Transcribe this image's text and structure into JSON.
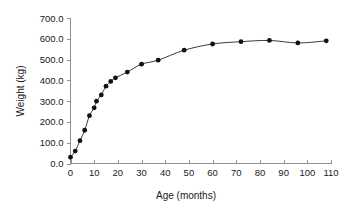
{
  "chart_data": {
    "type": "line",
    "title": "",
    "xlabel": "Age (months)",
    "ylabel": "Weight (kg)",
    "xlim": [
      0,
      110
    ],
    "ylim": [
      0,
      700
    ],
    "grid": false,
    "legend": null,
    "marker": "filled-circle",
    "line_color": "#3a3a3a",
    "marker_color": "#111111",
    "xticks": [
      0,
      10,
      20,
      30,
      40,
      50,
      60,
      70,
      80,
      90,
      100,
      110
    ],
    "xtick_labels": [
      "0",
      "10",
      "20",
      "30",
      "40",
      "50",
      "60",
      "70",
      "80",
      "90",
      "100",
      "110"
    ],
    "yticks": [
      0,
      100,
      200,
      300,
      400,
      500,
      600,
      700
    ],
    "ytick_labels": [
      "0.0",
      "100.0",
      "200.0",
      "300.0",
      "400.0",
      "500.0",
      "600.0",
      "700.0"
    ],
    "x": [
      0,
      2,
      4,
      6,
      8,
      10,
      11,
      13,
      15,
      17,
      19,
      24,
      30,
      37,
      48,
      60,
      72,
      84,
      96,
      108
    ],
    "values": [
      30,
      60,
      110,
      160,
      230,
      268,
      300,
      330,
      372,
      395,
      412,
      440,
      478,
      497,
      545,
      575,
      586,
      592,
      580,
      590
    ],
    "series": [
      {
        "name": "Weight",
        "x": [
          0,
          2,
          4,
          6,
          8,
          10,
          11,
          13,
          15,
          17,
          19,
          24,
          30,
          37,
          48,
          60,
          72,
          84,
          96,
          108
        ],
        "values": [
          30,
          60,
          110,
          160,
          230,
          268,
          300,
          330,
          372,
          395,
          412,
          440,
          478,
          497,
          545,
          575,
          586,
          592,
          580,
          590
        ]
      }
    ]
  },
  "axes": {
    "y_title": "Weight (kg)",
    "x_title": "Age (months)"
  }
}
